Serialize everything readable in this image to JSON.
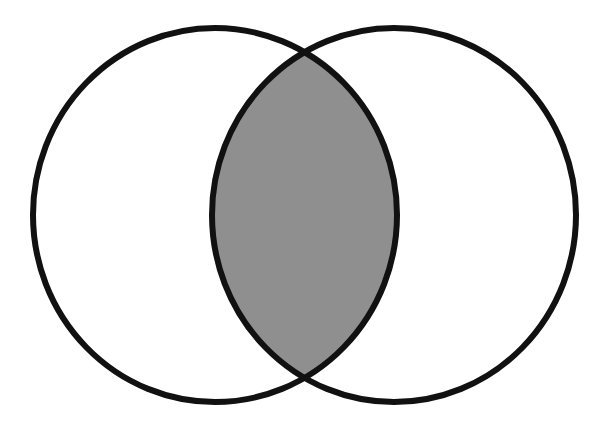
{
  "diagram": {
    "type": "venn",
    "sets": [
      {
        "name": "set-a",
        "cx": 215,
        "cy": 215,
        "rx": 182,
        "ry": 187
      },
      {
        "name": "set-b",
        "cx": 394,
        "cy": 215,
        "rx": 182,
        "ry": 187
      }
    ],
    "highlighted_region": "intersection",
    "colors": {
      "background": "#ffffff",
      "stroke": "#111111",
      "intersection_fill": "#8f8f8f"
    },
    "stroke_width": 6
  }
}
